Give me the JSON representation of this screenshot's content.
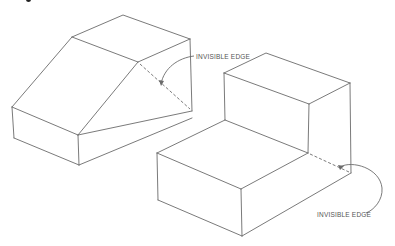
{
  "diagram": {
    "type": "isometric-drawing",
    "colors": {
      "line": "#6b6b6b",
      "text": "#555555",
      "background": "#ffffff"
    },
    "figures": [
      {
        "name": "wedge-block",
        "label": {
          "text": "INVISIBLE EDGE",
          "x": 196,
          "y": 53
        },
        "hidden_edge": {
          "from": [
            138,
            62
          ],
          "to": [
            192,
            111
          ]
        }
      },
      {
        "name": "step-block",
        "label": {
          "text": "INVISIBLE EDGE",
          "x": 317,
          "y": 211
        },
        "hidden_edge": {
          "from": [
            308,
            153
          ],
          "to": [
            351,
            173
          ]
        }
      }
    ]
  }
}
